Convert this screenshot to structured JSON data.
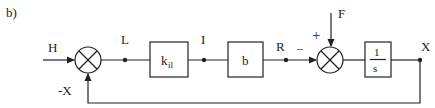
{
  "figure": {
    "panel_label": "b)",
    "signals": {
      "input": "H",
      "feedback": "-X",
      "after_sum1": "L",
      "after_kil": "I",
      "after_b": "R",
      "disturbance": "F",
      "output": "X"
    },
    "blocks": [
      {
        "id": "kil",
        "label_main": "k",
        "label_sub": "il"
      },
      {
        "id": "b",
        "label_main": "b"
      },
      {
        "id": "integrator",
        "numerator": "1",
        "denominator": "s"
      }
    ],
    "sum2_signs": {
      "plus": "+",
      "minus": "−"
    }
  }
}
